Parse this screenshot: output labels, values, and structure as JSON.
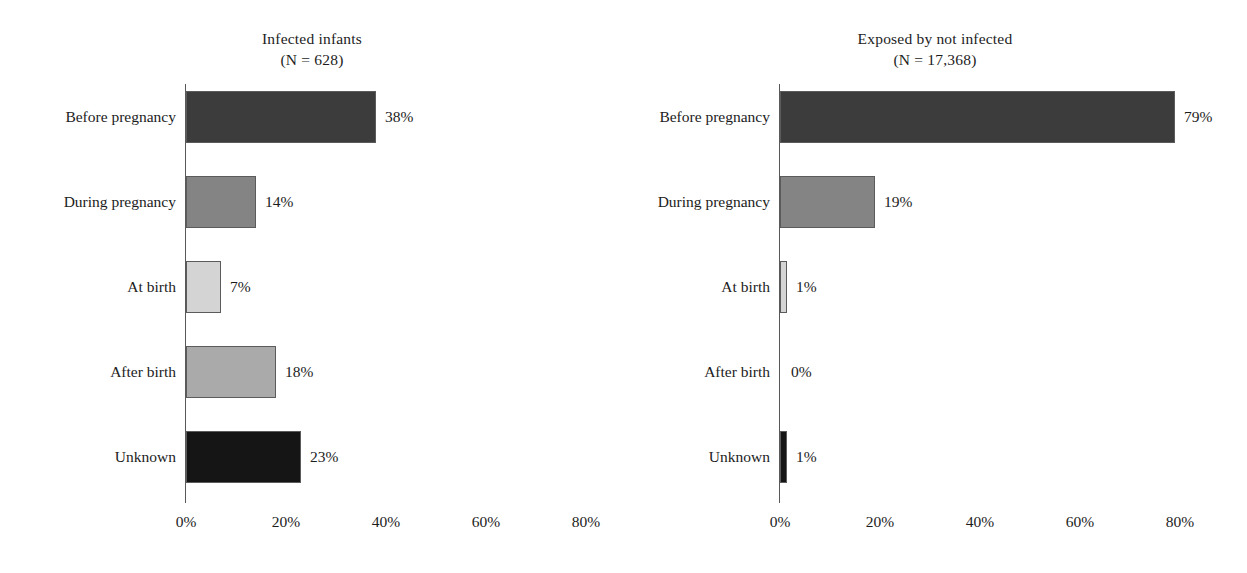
{
  "chart_data": [
    {
      "type": "bar",
      "orientation": "horizontal",
      "title": "Infected infants",
      "subtitle": "(N = 628)",
      "categories": [
        "Before pregnancy",
        "During pregnancy",
        "At birth",
        "After birth",
        "Unknown"
      ],
      "values": [
        38,
        14,
        7,
        18,
        23
      ],
      "value_labels": [
        "38%",
        "14%",
        "7%",
        "18%",
        "23%"
      ],
      "bar_colors": [
        "#3c3c3c",
        "#848484",
        "#d4d4d4",
        "#aaaaaa",
        "#151515"
      ],
      "xlabel": "",
      "ylabel": "",
      "xlim": [
        0,
        86
      ],
      "xticks": [
        0,
        20,
        40,
        60,
        80
      ],
      "xtick_labels": [
        "0%",
        "20%",
        "40%",
        "60%",
        "80%"
      ],
      "grid": false,
      "legend": "none"
    },
    {
      "type": "bar",
      "orientation": "horizontal",
      "title": "Exposed by not infected",
      "subtitle": "(N = 17,368)",
      "categories": [
        "Before pregnancy",
        "During pregnancy",
        "At birth",
        "After birth",
        "Unknown"
      ],
      "values": [
        79,
        19,
        1,
        0,
        1
      ],
      "value_labels": [
        "79%",
        "19%",
        "1%",
        "0%",
        "1%"
      ],
      "bar_colors": [
        "#3c3c3c",
        "#848484",
        "#d4d4d4",
        "#aaaaaa",
        "#151515"
      ],
      "xlabel": "",
      "ylabel": "",
      "xlim": [
        0,
        86
      ],
      "xticks": [
        0,
        20,
        40,
        60,
        80
      ],
      "xtick_labels": [
        "0%",
        "20%",
        "40%",
        "60%",
        "80%"
      ],
      "grid": false,
      "legend": "none"
    }
  ],
  "panels": {
    "left": {
      "title": "Infected infants",
      "subtitle": "(N = 628)",
      "rows": [
        {
          "label": "Before pregnancy",
          "value": 38,
          "value_label": "38%",
          "color": "#3c3c3c"
        },
        {
          "label": "During pregnancy",
          "value": 14,
          "value_label": "14%",
          "color": "#848484"
        },
        {
          "label": "At birth",
          "value": 7,
          "value_label": "7%",
          "color": "#d4d4d4"
        },
        {
          "label": "After birth",
          "value": 18,
          "value_label": "18%",
          "color": "#aaaaaa"
        },
        {
          "label": "Unknown",
          "value": 23,
          "value_label": "23%",
          "color": "#151515"
        }
      ],
      "xtick_labels": [
        "0%",
        "20%",
        "40%",
        "60%",
        "80%"
      ]
    },
    "right": {
      "title": "Exposed by not infected",
      "subtitle": "(N = 17,368)",
      "rows": [
        {
          "label": "Before pregnancy",
          "value": 79,
          "value_label": "79%",
          "color": "#3c3c3c"
        },
        {
          "label": "During pregnancy",
          "value": 19,
          "value_label": "19%",
          "color": "#848484"
        },
        {
          "label": "At birth",
          "value": 1,
          "value_label": "1%",
          "color": "#d4d4d4"
        },
        {
          "label": "After birth",
          "value": 0,
          "value_label": "0%",
          "color": "#aaaaaa"
        },
        {
          "label": "Unknown",
          "value": 1,
          "value_label": "1%",
          "color": "#151515"
        }
      ],
      "xtick_labels": [
        "0%",
        "20%",
        "40%",
        "60%",
        "80%"
      ]
    }
  },
  "caption": "",
  "colors": {
    "axis": "#595959",
    "text": "#1c1c1c",
    "background": "#ffffff"
  }
}
